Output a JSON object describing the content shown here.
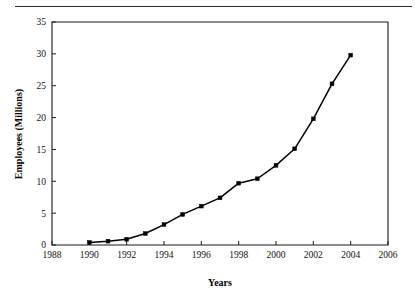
{
  "figure": {
    "rule_label": "top-horizontal-rule"
  },
  "chart_data": {
    "type": "line",
    "title": "",
    "xlabel": "Years",
    "ylabel": "Employees (Millions)",
    "xlim": [
      1988,
      2006
    ],
    "ylim": [
      0,
      35
    ],
    "xticks": [
      1988,
      1990,
      1992,
      1994,
      1996,
      1998,
      2000,
      2002,
      2004,
      2006
    ],
    "xtick_labels": [
      "1988",
      "1990",
      "1992",
      "1994",
      "1996",
      "1998",
      "2000",
      "2002",
      "2004",
      "2006"
    ],
    "yticks": [
      0,
      5,
      10,
      15,
      20,
      25,
      30,
      35
    ],
    "ytick_labels": [
      "0",
      "5",
      "10",
      "15",
      "20",
      "25",
      "30",
      "35"
    ],
    "grid": false,
    "legend": false,
    "legend_position": "none",
    "marker": "square",
    "line_color": "#000000",
    "marker_color": "#000000",
    "background_color": "#ffffff",
    "x": [
      1990,
      1991,
      1992,
      1993,
      1994,
      1995,
      1996,
      1997,
      1998,
      1999,
      2000,
      2001,
      2002,
      2003,
      2004
    ],
    "values": [
      0.4,
      0.6,
      0.9,
      1.8,
      3.2,
      4.8,
      6.1,
      7.4,
      9.7,
      10.4,
      12.5,
      15.1,
      19.8,
      25.3,
      29.8
    ],
    "series": [
      {
        "name": "Employees",
        "x": [
          1990,
          1991,
          1992,
          1993,
          1994,
          1995,
          1996,
          1997,
          1998,
          1999,
          2000,
          2001,
          2002,
          2003,
          2004
        ],
        "values": [
          0.4,
          0.6,
          0.9,
          1.8,
          3.2,
          4.8,
          6.1,
          7.4,
          9.7,
          10.4,
          12.5,
          15.1,
          19.8,
          25.3,
          29.8
        ]
      }
    ]
  }
}
